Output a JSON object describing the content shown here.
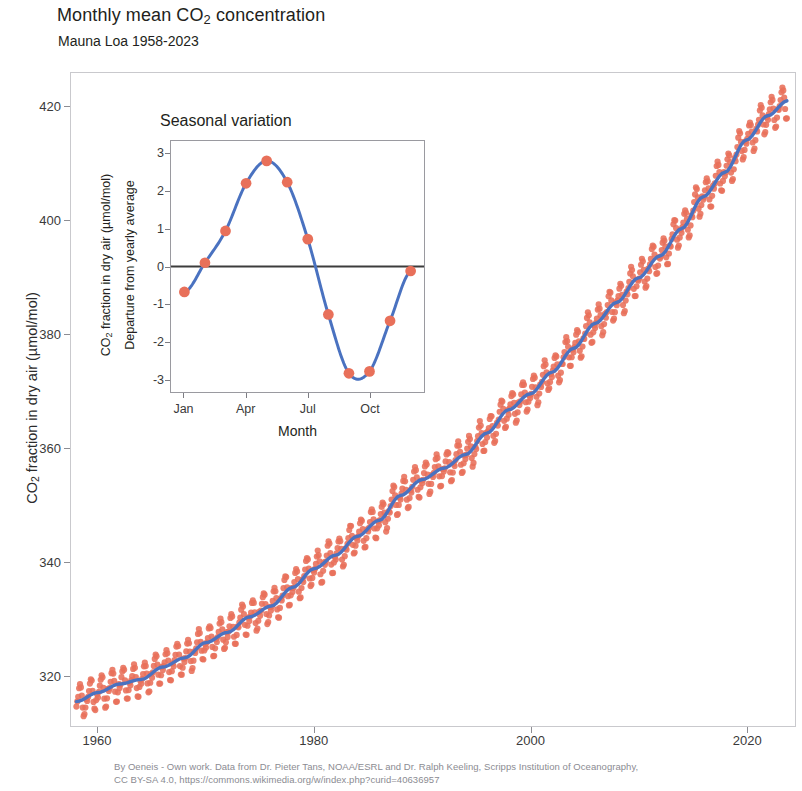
{
  "title": "Monthly mean CO2 concentration",
  "title_pre": "Monthly mean CO",
  "title_sub": "2",
  "title_post": " concentration",
  "subtitle": "Mauna Loa 1958-2023",
  "caption": {
    "line1": "By Oeneis - Own work. Data from Dr. Pieter Tans, NOAA/ESRL and Dr. Ralph Keeling, Scripps Institution of Oceanography,",
    "line2": "CC BY-SA 4.0, https://commons.wikimedia.org/w/index.php?curid=40636957"
  },
  "colors": {
    "marker": "#e8705a",
    "line": "#4a72c0",
    "zero_line": "#3c3c3c",
    "frame": "#c9c9cd",
    "tick_text": "#3a3a3a",
    "caption_text": "#8b8b92"
  },
  "chart_data": {
    "type": "scatter",
    "title": "Monthly mean CO2 concentration",
    "subtitle": "Mauna Loa 1958-2023",
    "xlabel": "",
    "ylabel_pre": "CO",
    "ylabel_sub": "2",
    "ylabel_post": " fraction in dry air (µmol/mol)",
    "ylabel": "CO2 fraction in dry air (µmol/mol)",
    "xlim": [
      1957.5,
      2024.5
    ],
    "ylim": [
      311,
      426
    ],
    "grid": false,
    "legend": "none",
    "xticks": [
      1960,
      1980,
      2000,
      2020
    ],
    "xticklabels": [
      "1960",
      "1980",
      "2000",
      "2020"
    ],
    "yticks": [
      320,
      340,
      360,
      380,
      400,
      420
    ],
    "yticklabels": [
      "320",
      "340",
      "360",
      "380",
      "400",
      "420"
    ],
    "series": [
      {
        "name": "Monthly mean CO2",
        "type": "scatter",
        "marker": "circle",
        "color": "#e8705a",
        "note": "Monthly values scattered about the annual trend with a seasonal cycle of amplitude about 3 umol/mol"
      },
      {
        "name": "Annual trend",
        "type": "line",
        "color": "#4a72c0",
        "x": [
          1958,
          1960,
          1962,
          1964,
          1966,
          1968,
          1970,
          1972,
          1974,
          1976,
          1978,
          1980,
          1982,
          1984,
          1986,
          1988,
          1990,
          1992,
          1994,
          1996,
          1998,
          2000,
          2002,
          2004,
          2006,
          2008,
          2010,
          2012,
          2014,
          2016,
          2018,
          2020,
          2022,
          2023.8
        ],
        "values": [
          315.3,
          316.9,
          318.4,
          319.2,
          321.4,
          323.0,
          325.7,
          327.5,
          330.2,
          332.1,
          335.4,
          338.7,
          341.1,
          344.4,
          347.2,
          351.6,
          354.4,
          356.4,
          358.8,
          362.6,
          366.7,
          369.5,
          373.3,
          377.5,
          381.9,
          385.6,
          389.9,
          393.8,
          398.6,
          404.2,
          408.5,
          414.2,
          418.5,
          421.1
        ]
      }
    ],
    "inset": {
      "type": "line",
      "title": "Seasonal variation",
      "xlabel": "Month",
      "ylabel_line1_pre": "CO",
      "ylabel_line1_sub": "2",
      "ylabel_line1_post": " fraction in dry air (µmol/mol)",
      "ylabel_line1": "CO2 fraction in dry air (µmol/mol)",
      "ylabel_line2": "Departure from yearly average",
      "xlim": [
        0.35,
        12.65
      ],
      "ylim": [
        -3.35,
        3.35
      ],
      "xticks": [
        1,
        4,
        7,
        10
      ],
      "xticklabels": [
        "Jan",
        "Apr",
        "Jul",
        "Oct"
      ],
      "yticks": [
        3,
        2,
        1,
        0,
        -1,
        -2,
        -3
      ],
      "yticklabels": [
        "3",
        "2",
        "1",
        "0",
        "-1",
        "-2",
        "-3"
      ],
      "zero_line": true,
      "categories": [
        "Jan",
        "Feb",
        "Mar",
        "Apr",
        "May",
        "Jun",
        "Jul",
        "Aug",
        "Sep",
        "Oct",
        "Nov",
        "Dec"
      ],
      "values": [
        -0.68,
        0.1,
        0.95,
        2.22,
        2.82,
        2.25,
        0.73,
        -1.28,
        -2.85,
        -2.8,
        -1.45,
        -0.12
      ]
    }
  }
}
